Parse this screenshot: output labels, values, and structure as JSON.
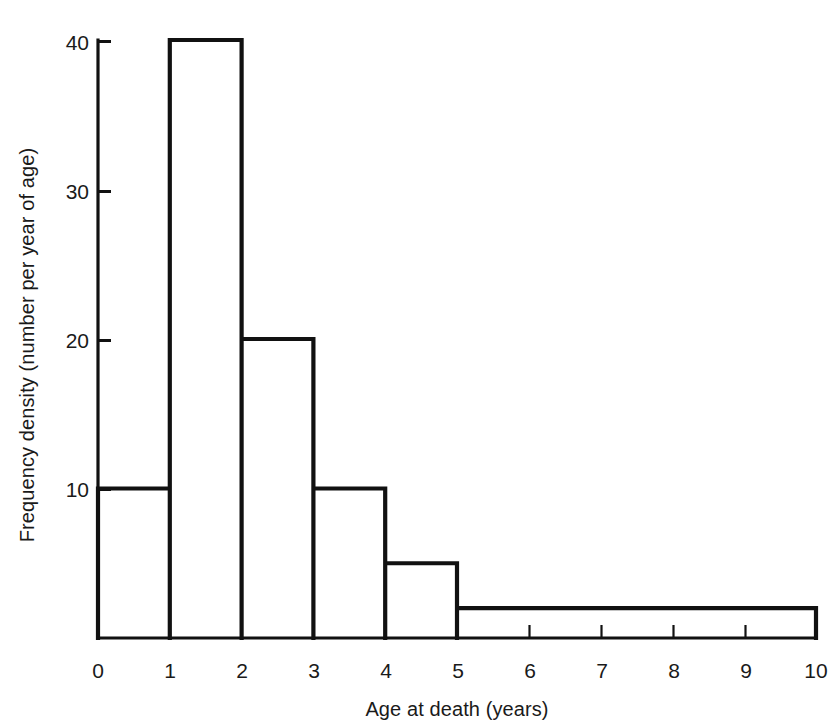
{
  "chart_data": {
    "type": "bar",
    "subtype": "histogram",
    "title": "",
    "subtitle": "",
    "xlabel": "Age at death (years)",
    "ylabel": "Frequency density (number per year of age)",
    "xlim": [
      0,
      10
    ],
    "ylim": [
      0,
      40
    ],
    "grid": false,
    "legend": null,
    "legend_position": "none",
    "x_tick_labels": [
      "0",
      "1",
      "2",
      "3",
      "4",
      "5",
      "6",
      "7",
      "8",
      "9",
      "10"
    ],
    "x_ticks": [
      0,
      1,
      2,
      3,
      4,
      5,
      6,
      7,
      8,
      9,
      10
    ],
    "y_tick_labels": [
      "10",
      "20",
      "30",
      "40"
    ],
    "y_ticks": [
      10,
      20,
      30,
      40
    ],
    "bin_edges": [
      0,
      1,
      2,
      3,
      4,
      5,
      10
    ],
    "categories": [
      "0-1",
      "1-2",
      "2-3",
      "3-4",
      "4-5",
      "5-10"
    ],
    "values": [
      10,
      40,
      20,
      10,
      5,
      2
    ],
    "bars": [
      {
        "label": "0-1",
        "x0": 0,
        "x1": 1,
        "density": 10,
        "count": 10
      },
      {
        "label": "1-2",
        "x0": 1,
        "x1": 2,
        "density": 40,
        "count": 40
      },
      {
        "label": "2-3",
        "x0": 2,
        "x1": 3,
        "density": 20,
        "count": 20
      },
      {
        "label": "3-4",
        "x0": 3,
        "x1": 4,
        "density": 10,
        "count": 10
      },
      {
        "label": "4-5",
        "x0": 4,
        "x1": 5,
        "density": 5,
        "count": 5
      },
      {
        "label": "5-10",
        "x0": 5,
        "x1": 10,
        "density": 2,
        "count": 10
      }
    ],
    "annotations": [],
    "colors": {
      "line": "#111111",
      "fill": "#ffffff",
      "background": "#ffffff",
      "text": "#1a1a1a"
    }
  }
}
